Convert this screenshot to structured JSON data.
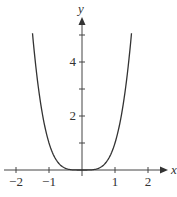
{
  "chart_data": {
    "type": "line",
    "title": "",
    "function": "y = x^4",
    "xlabel": "x",
    "ylabel": "y",
    "xlim": [
      -2.2,
      2.6
    ],
    "ylim": [
      0,
      5.6
    ],
    "x_ticks": [
      -2,
      -1,
      0,
      1,
      2
    ],
    "x_tick_labels": [
      "−2",
      "−1",
      "",
      "1",
      "2"
    ],
    "y_ticks": [
      1,
      2,
      3,
      4,
      5
    ],
    "y_tick_labels": [
      "",
      "2",
      "",
      "4",
      ""
    ],
    "grid": false,
    "series": [
      {
        "name": "y = x^4",
        "x": [
          -1.5,
          -1.25,
          -1,
          -0.75,
          -0.5,
          -0.25,
          0,
          0.25,
          0.5,
          0.75,
          1,
          1.25,
          1.5
        ],
        "values": [
          5.06,
          2.44,
          1,
          0.32,
          0.06,
          0.004,
          0,
          0.004,
          0.06,
          0.32,
          1,
          2.44,
          5.06
        ]
      }
    ]
  }
}
